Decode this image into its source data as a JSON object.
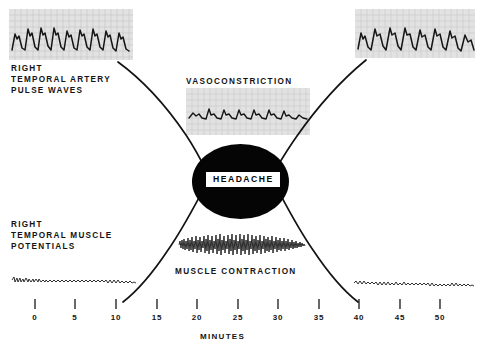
{
  "figure": {
    "background_color": "#ffffff",
    "ink_color": "#101010"
  },
  "labels": {
    "artery": "RIGHT\nTEMPORAL ARTERY\nPULSE WAVES",
    "muscle": "RIGHT\nTEMPORAL MUSCLE\nPOTENTIALS",
    "vasoconstriction": "VASOCONSTRICTION",
    "muscle_contraction": "MUSCLE CONTRACTION",
    "headache": "HEADACHE",
    "x_axis_title": "MINUTES"
  },
  "chart_data": {
    "type": "line",
    "xlabel": "MINUTES",
    "ylabel": "",
    "xlim": [
      0,
      53
    ],
    "ylim": [
      0,
      1
    ],
    "grid": false,
    "legend": "none",
    "categories": [
      "0",
      "5",
      "10",
      "15",
      "20",
      "25",
      "30",
      "35",
      "40",
      "45",
      "50"
    ],
    "tick_values": [
      0,
      5,
      10,
      15,
      20,
      25,
      30,
      35,
      40,
      45,
      50
    ],
    "axis_pixels": {
      "x0_px": 35,
      "px_per_unit": 8.1,
      "baseline_y_px": 303
    },
    "series": [
      {
        "name": "VASOCONSTRICTION",
        "note": "Upper curve: temporal artery pulse amplitude falls from high to low across headache onset, then recovers.",
        "points": [
          {
            "x": 10.5,
            "y": 0.97
          },
          {
            "x": 14.0,
            "y": 0.86
          },
          {
            "x": 17.5,
            "y": 0.7
          },
          {
            "x": 20.5,
            "y": 0.55
          },
          {
            "x": 23.0,
            "y": 0.45
          },
          {
            "x": 26.5,
            "y": 0.4
          },
          {
            "x": 30.0,
            "y": 0.45
          },
          {
            "x": 33.0,
            "y": 0.56
          },
          {
            "x": 36.0,
            "y": 0.71
          },
          {
            "x": 39.5,
            "y": 0.87
          },
          {
            "x": 43.0,
            "y": 0.97
          }
        ]
      },
      {
        "name": "MUSCLE CONTRACTION",
        "note": "Lower curve: temporal muscle potentials rise from baseline to a sustained peak during headache, then return to baseline.",
        "points": [
          {
            "x": 11.0,
            "y": 0.02
          },
          {
            "x": 14.0,
            "y": 0.13
          },
          {
            "x": 17.0,
            "y": 0.28
          },
          {
            "x": 20.0,
            "y": 0.43
          },
          {
            "x": 23.0,
            "y": 0.53
          },
          {
            "x": 26.5,
            "y": 0.57
          },
          {
            "x": 30.0,
            "y": 0.53
          },
          {
            "x": 33.0,
            "y": 0.43
          },
          {
            "x": 36.0,
            "y": 0.28
          },
          {
            "x": 38.5,
            "y": 0.12
          },
          {
            "x": 39.5,
            "y": 0.02
          }
        ]
      }
    ],
    "event_marker": {
      "label": "HEADACHE",
      "x_center": 25.5,
      "x_start": 19.5,
      "x_end": 31.5
    },
    "traces": [
      {
        "id": "artery-baseline-left",
        "label": "RIGHT TEMPORAL ARTERY PULSE WAVES",
        "state": "large pulse waves",
        "amplitude": "high",
        "time_window": [
          0,
          11
        ]
      },
      {
        "id": "artery-vasoconstriction",
        "label": "VASOCONSTRICTION",
        "state": "damped flattened pulse waves",
        "amplitude": "low",
        "time_window": [
          19,
          31
        ]
      },
      {
        "id": "artery-baseline-right",
        "label": "RIGHT TEMPORAL ARTERY PULSE WAVES",
        "state": "large pulse waves restored",
        "amplitude": "high",
        "time_window": [
          40,
          52
        ]
      },
      {
        "id": "emg-baseline-left",
        "label": "RIGHT TEMPORAL MUSCLE POTENTIALS",
        "state": "low flat EMG baseline",
        "amplitude": "low",
        "time_window": [
          0,
          11
        ]
      },
      {
        "id": "emg-contraction",
        "label": "MUSCLE CONTRACTION",
        "state": "high amplitude EMG burst",
        "amplitude": "high",
        "time_window": [
          19,
          31
        ]
      },
      {
        "id": "emg-baseline-right",
        "label": "RIGHT TEMPORAL MUSCLE POTENTIALS",
        "state": "low flat EMG baseline restored",
        "amplitude": "low",
        "time_window": [
          40,
          52
        ]
      }
    ]
  },
  "axis": {
    "ticks": [
      {
        "label": "0",
        "x_px": 35
      },
      {
        "label": "5",
        "x_px": 75
      },
      {
        "label": "10",
        "x_px": 116
      },
      {
        "label": "15",
        "x_px": 157
      },
      {
        "label": "20",
        "x_px": 197
      },
      {
        "label": "25",
        "x_px": 238
      },
      {
        "label": "30",
        "x_px": 278
      },
      {
        "label": "35",
        "x_px": 319
      },
      {
        "label": "40",
        "x_px": 359
      },
      {
        "label": "45",
        "x_px": 400
      },
      {
        "label": "50",
        "x_px": 440
      }
    ]
  }
}
